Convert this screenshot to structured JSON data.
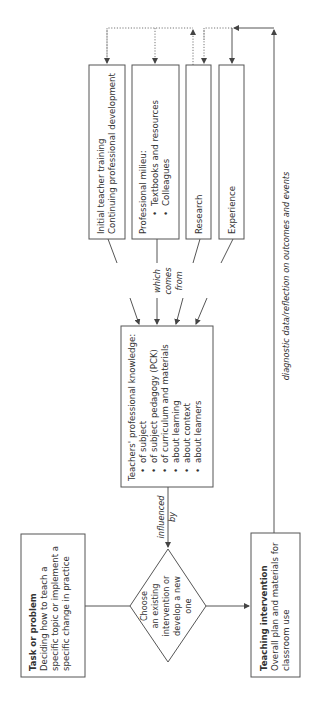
{
  "diagram": {
    "orientation": "rotated-90-ccw",
    "colors": {
      "stroke": "#555555",
      "text": "#333333",
      "background": "#ffffff"
    },
    "sources": [
      {
        "id": "training",
        "lines": [
          "Initial teacher training",
          "Continuing professional development"
        ]
      },
      {
        "id": "milieu",
        "title": "Professional milieu:",
        "bullets": [
          "Textbooks and resources",
          "Colleagues"
        ]
      },
      {
        "id": "research",
        "lines": [
          "Research"
        ]
      },
      {
        "id": "experience",
        "lines": [
          "Experience"
        ]
      }
    ],
    "source_label": [
      "which",
      "comes",
      "from"
    ],
    "knowledge": {
      "title": "Teachers' professional knowledge:",
      "bullets": [
        "of subject",
        "of subject pedagogy (PCK)",
        "of curriculum and materials",
        "about learning",
        "about context",
        "about learners"
      ]
    },
    "influence_label": [
      "influenced",
      "by"
    ],
    "decision": {
      "lines": [
        "Choose",
        "an existing",
        "intervention or",
        "develop a new",
        "one"
      ]
    },
    "task": {
      "title": "Task or problem",
      "lines": [
        "Deciding how to teach a",
        "specific topic or implement a",
        "specific change in practice"
      ]
    },
    "intervention": {
      "title": "Teaching intervention",
      "lines": [
        "Overall plan and materials for",
        "classroom use"
      ]
    },
    "feedback_label": "diagnostic data/reflection on outcomes and events",
    "bullet_glyph": "•"
  }
}
